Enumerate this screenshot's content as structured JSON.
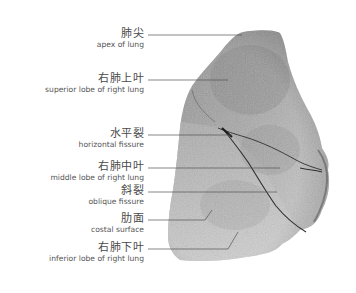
{
  "diagram": {
    "colors": {
      "background": "#ffffff",
      "lung_base": "#a8a8a8",
      "lung_dark": "#6e6e6e",
      "lung_light": "#d0d0d0",
      "leader_line": "#555555",
      "text": "#4a4a4a"
    },
    "labels": [
      {
        "zh": "肺尖",
        "en": "apex of lung",
        "y": 33,
        "line": {
          "x1": 148,
          "y1": 35,
          "x2": 240,
          "y2": 35
        }
      },
      {
        "zh": "右肺上叶",
        "en": "superior lobe of right lung",
        "y": 77,
        "line": {
          "x1": 148,
          "y1": 80,
          "x2": 228,
          "y2": 80
        }
      },
      {
        "zh": "水平裂",
        "en": "horizontal fissure",
        "y": 133,
        "line": {
          "x1": 148,
          "y1": 135,
          "x2": 232,
          "y2": 135
        }
      },
      {
        "zh": "右肺中叶",
        "en": "middle lobe of right lung",
        "y": 165,
        "line": {
          "x1": 148,
          "y1": 168,
          "x2": 280,
          "y2": 168
        }
      },
      {
        "zh": "斜裂",
        "en": "oblique fissure",
        "y": 189,
        "line": {
          "x1": 148,
          "y1": 192,
          "x2": 277,
          "y2": 192
        }
      },
      {
        "zh": "肋面",
        "en": "costal surface",
        "y": 217,
        "line": {
          "x1": 148,
          "y1": 220,
          "x2": 205,
          "y2": 220,
          "bend_x": 212,
          "bend_y": 210
        }
      },
      {
        "zh": "右肺下叶",
        "en": "inferior lobe of right lung",
        "y": 246,
        "line": {
          "x1": 148,
          "y1": 249,
          "x2": 228,
          "y2": 249,
          "bend_x": 238,
          "bend_y": 232
        }
      }
    ]
  }
}
